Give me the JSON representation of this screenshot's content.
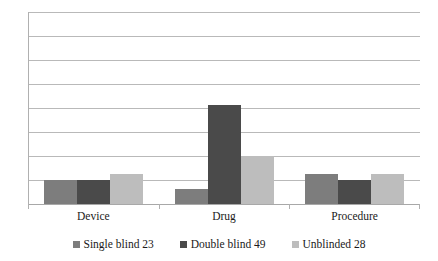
{
  "chart_data": {
    "type": "bar",
    "title": "",
    "subtitle": "",
    "xlabel": "",
    "ylabel": "",
    "categories": [
      "Device",
      "Drug",
      "Procedure"
    ],
    "series": [
      {
        "name": "Single blind 23",
        "color": "#7d7d7d",
        "values": [
          8,
          5,
          10
        ]
      },
      {
        "name": "Double blind 49",
        "color": "#4a4a4a",
        "values": [
          8,
          33,
          8
        ]
      },
      {
        "name": "Unblinded  28",
        "color": "#bdbdbd",
        "values": [
          10,
          16,
          10
        ]
      }
    ],
    "ylim": [
      0,
      64
    ],
    "y_tick_labels": [],
    "gridline_count": 9,
    "gridline_interval": 8,
    "grid": true,
    "legend_position": "bottom",
    "annotations": []
  },
  "axis": {
    "categories": [
      "Device",
      "Drug",
      "Procedure"
    ]
  },
  "legend": {
    "entries": [
      {
        "label": "Single blind 23"
      },
      {
        "label": "Double blind 49"
      },
      {
        "label": "Unblinded  28"
      }
    ]
  },
  "colors": {
    "single_blind": "#7d7d7d",
    "double_blind": "#4a4a4a",
    "unblinded": "#bdbdbd",
    "gridline": "#b9b9b9",
    "axis": "#b0b0b0",
    "background": "#ffffff"
  }
}
